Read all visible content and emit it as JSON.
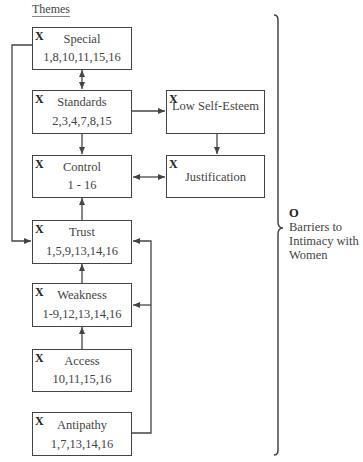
{
  "diagram": {
    "title": "Themes",
    "theme_marker": "X",
    "themes": [
      {
        "id": "special",
        "name": "Special",
        "cases": "1,8,10,11,15,16"
      },
      {
        "id": "standards",
        "name": "Standards",
        "cases": "2,3,4,7,8,15"
      },
      {
        "id": "low-self-esteem",
        "name": "Low Self-Esteem",
        "cases": ""
      },
      {
        "id": "control",
        "name": "Control",
        "cases": "1 - 16"
      },
      {
        "id": "justification",
        "name": "Justification",
        "cases": ""
      },
      {
        "id": "trust",
        "name": "Trust",
        "cases": "1,5,9,13,14,16"
      },
      {
        "id": "weakness",
        "name": "Weakness",
        "cases": "1-9,12,13,14,16"
      },
      {
        "id": "access",
        "name": "Access",
        "cases": "10,11,15,16"
      },
      {
        "id": "antipathy",
        "name": "Antipathy",
        "cases": "1,7,13,14,16"
      }
    ],
    "outcome": {
      "marker": "O",
      "label_lines": [
        "Barriers to",
        "Intimacy with",
        "Women"
      ]
    },
    "connections": [
      {
        "from": "special",
        "to": "standards",
        "type": "bidirectional"
      },
      {
        "from": "standards",
        "to": "low-self-esteem",
        "type": "arrow"
      },
      {
        "from": "standards",
        "to": "control",
        "type": "arrow"
      },
      {
        "from": "low-self-esteem",
        "to": "justification",
        "type": "arrow"
      },
      {
        "from": "control",
        "to": "justification",
        "type": "bidirectional"
      },
      {
        "from": "special",
        "to": "trust",
        "type": "arrow"
      },
      {
        "from": "trust",
        "to": "control",
        "type": "arrow"
      },
      {
        "from": "weakness",
        "to": "trust",
        "type": "arrow"
      },
      {
        "from": "access",
        "to": "weakness",
        "type": "arrow"
      },
      {
        "from": "antipathy",
        "to": "trust",
        "type": "arrow"
      },
      {
        "from": "antipathy",
        "to": "weakness",
        "type": "arrow"
      }
    ]
  }
}
